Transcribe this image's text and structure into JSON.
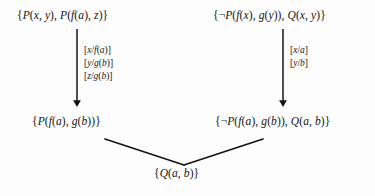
{
  "diagram": {
    "background_color": "#fdfdfd",
    "ink_color": "#141414",
    "nodes": {
      "top_left": {
        "id": "clause-top-left",
        "text": "{P(x, y), P(f(a), z)}",
        "role": "parent-clause"
      },
      "top_right": {
        "id": "clause-top-right",
        "text": "{¬P(f(x), g(y)), Q(x, y)}",
        "role": "parent-clause"
      },
      "mid_left": {
        "id": "clause-mid-left",
        "text": "{P(f(a), g(b))}",
        "role": "factored-clause"
      },
      "mid_right": {
        "id": "clause-mid-right",
        "text": "{¬P(f(a), g(b)), Q(a, b)}",
        "role": "instantiated-clause"
      },
      "bottom": {
        "id": "clause-bottom",
        "text": "{Q(a, b)}",
        "role": "resolvent"
      }
    },
    "substitutions": {
      "left": {
        "id": "subst-left",
        "lines": [
          "[x/f(a)]",
          "[y/g(b)]",
          "[z/g(b)]"
        ]
      },
      "right": {
        "id": "subst-right",
        "lines": [
          "[x/a]",
          "[y/b]"
        ]
      }
    },
    "edges": [
      {
        "id": "arrow-left",
        "type": "arrow",
        "from": "top_left",
        "to": "mid_left"
      },
      {
        "id": "arrow-right",
        "type": "arrow",
        "from": "top_right",
        "to": "mid_right"
      },
      {
        "id": "line-resolve-left",
        "type": "line",
        "from": "mid_left",
        "to": "bottom"
      },
      {
        "id": "line-resolve-right",
        "type": "line",
        "from": "mid_right",
        "to": "bottom"
      }
    ]
  }
}
